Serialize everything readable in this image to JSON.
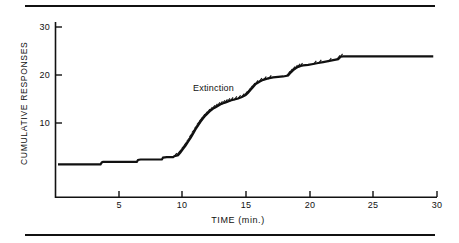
{
  "figure": {
    "has_top_rule": true,
    "has_bottom_rule": true,
    "background_color": "#ffffff",
    "ink_color": "#111111"
  },
  "chart_data": {
    "type": "line",
    "title": "",
    "subtitle": "",
    "xlabel": "TIME (min.)",
    "ylabel": "CUMULATIVE RESPONSES",
    "xlim": [
      0,
      30.5
    ],
    "ylim": [
      0,
      32
    ],
    "grid": false,
    "legend": null,
    "legend_position": "none",
    "xticks": [
      5,
      10,
      15,
      20,
      25,
      30
    ],
    "xtick_labels": [
      "5",
      "10",
      "15",
      "20",
      "25",
      "30"
    ],
    "yticks": [
      10,
      20,
      30
    ],
    "ytick_labels": [
      "10",
      "20",
      "30"
    ],
    "annotations": [
      {
        "text": "Extinction",
        "x": 11.3,
        "y": 18.2
      }
    ],
    "series": [
      {
        "name": "Cumulative responses",
        "style": "step",
        "color": "#111111",
        "x": [
          0.2,
          3.6,
          3.7,
          3.8,
          4.0,
          6.5,
          6.6,
          6.8,
          8.5,
          8.6,
          8.9,
          9.4,
          9.5,
          9.8,
          10.0,
          10.2,
          10.4,
          10.6,
          10.8,
          11.0,
          11.2,
          11.4,
          11.6,
          11.8,
          12.0,
          12.2,
          12.4,
          12.6,
          12.8,
          13.0,
          13.2,
          13.4,
          13.6,
          13.8,
          14.0,
          14.3,
          14.6,
          14.9,
          15.2,
          15.4,
          15.6,
          15.8,
          16.0,
          16.3,
          16.6,
          17.0,
          17.4,
          17.8,
          18.2,
          18.6,
          18.8,
          19.0,
          19.2,
          19.4,
          19.6,
          19.8,
          20.2,
          20.6,
          21.0,
          21.4,
          21.8,
          22.2,
          22.6,
          22.8,
          23.0,
          26.0,
          30.2
        ],
        "y": [
          1.5,
          1.5,
          1.9,
          2.0,
          2.0,
          2.0,
          2.4,
          2.5,
          2.5,
          2.9,
          3.0,
          3.0,
          3.2,
          3.4,
          4.0,
          4.7,
          5.4,
          6.2,
          7.0,
          7.9,
          8.8,
          9.6,
          10.4,
          11.1,
          11.7,
          12.2,
          12.7,
          13.1,
          13.4,
          13.7,
          14.0,
          14.2,
          14.4,
          14.6,
          14.8,
          15.0,
          15.2,
          15.5,
          15.9,
          16.4,
          17.0,
          17.6,
          18.2,
          18.7,
          19.1,
          19.4,
          19.6,
          19.7,
          19.8,
          20.0,
          20.6,
          21.1,
          21.5,
          21.8,
          22.0,
          22.1,
          22.2,
          22.4,
          22.6,
          22.8,
          23.0,
          23.2,
          23.4,
          23.9,
          24.0,
          24.0,
          24.0
        ]
      }
    ],
    "response_marks_note": "small hash ticks along the rising portion of the cumulative record"
  }
}
